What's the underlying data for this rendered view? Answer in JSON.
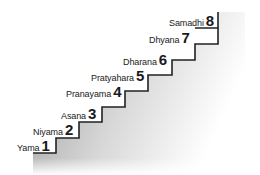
{
  "diagram": {
    "type": "staircase",
    "colors": {
      "line": "#222222",
      "shadow_dark": "#9a9a9a",
      "shadow_light": "#ffffff",
      "text": "#1a1a1a"
    },
    "steps": [
      {
        "name": "Yama",
        "number": "1"
      },
      {
        "name": "Niyama",
        "number": "2"
      },
      {
        "name": "Asana",
        "number": "3"
      },
      {
        "name": "Pranayama",
        "number": "4"
      },
      {
        "name": "Pratyahara",
        "number": "5"
      },
      {
        "name": "Dharana",
        "number": "6"
      },
      {
        "name": "Dhyana",
        "number": "7"
      },
      {
        "name": "Samadhi",
        "number": "8"
      }
    ]
  }
}
